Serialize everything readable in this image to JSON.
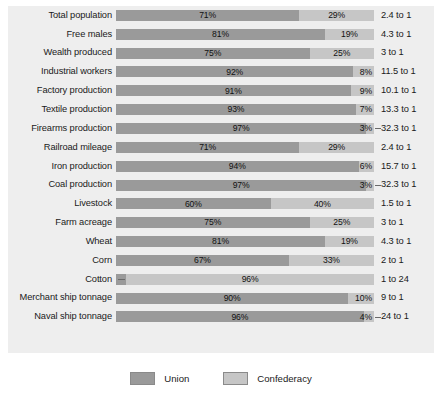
{
  "chart_data": {
    "type": "bar",
    "subtype": "stacked-horizontal-100-percent",
    "title": "",
    "xlabel": "",
    "ylabel": "",
    "xlim": [
      0,
      100
    ],
    "grid": false,
    "legend_position": "bottom-center",
    "categories": [
      "Total population",
      "Free males",
      "Wealth produced",
      "Industrial workers",
      "Factory production",
      "Textile production",
      "Firearms production",
      "Railroad mileage",
      "Iron production",
      "Coal production",
      "Livestock",
      "Farm acreage",
      "Wheat",
      "Corn",
      "Cotton",
      "Merchant ship tonnage",
      "Naval ship tonnage"
    ],
    "series": [
      {
        "name": "Union",
        "color": "#9a9a9a",
        "values": [
          71,
          81,
          75,
          92,
          91,
          93,
          97,
          71,
          94,
          97,
          60,
          75,
          81,
          67,
          4,
          90,
          96
        ]
      },
      {
        "name": "Confederacy",
        "color": "#c6c6c6",
        "values": [
          29,
          19,
          25,
          8,
          9,
          7,
          3,
          29,
          6,
          3,
          40,
          25,
          19,
          33,
          96,
          10,
          4
        ]
      }
    ],
    "annotations": {
      "column_header": "",
      "ratios": [
        "2.4 to 1",
        "4.3 to 1",
        "3 to 1",
        "11.5 to 1",
        "10.1 to 1",
        "13.3 to 1",
        "32.3 to 1",
        "2.4 to 1",
        "15.7 to 1",
        "32.3 to 1",
        "1.5 to 1",
        "3 to 1",
        "4.3 to 1",
        "2 to 1",
        "1 to 24",
        "9 to 1",
        "24 to 1"
      ]
    }
  },
  "rows": [
    {
      "label": "Total population",
      "union": 71,
      "conf": 29,
      "union_label": "71%",
      "conf_label": "29%",
      "ratio": "2.4 to 1",
      "conf_leader": false,
      "reversed": false
    },
    {
      "label": "Free males",
      "union": 81,
      "conf": 19,
      "union_label": "81%",
      "conf_label": "19%",
      "ratio": "4.3 to 1",
      "conf_leader": false,
      "reversed": false
    },
    {
      "label": "Wealth produced",
      "union": 75,
      "conf": 25,
      "union_label": "75%",
      "conf_label": "25%",
      "ratio": "3 to 1",
      "conf_leader": false,
      "reversed": false
    },
    {
      "label": "Industrial workers",
      "union": 92,
      "conf": 8,
      "union_label": "92%",
      "conf_label": "8%",
      "ratio": "11.5 to 1",
      "conf_leader": false,
      "reversed": false
    },
    {
      "label": "Factory production",
      "union": 91,
      "conf": 9,
      "union_label": "91%",
      "conf_label": "9%",
      "ratio": "10.1 to 1",
      "conf_leader": false,
      "reversed": false
    },
    {
      "label": "Textile production",
      "union": 93,
      "conf": 7,
      "union_label": "93%",
      "conf_label": "7%",
      "ratio": "13.3 to 1",
      "conf_leader": false,
      "reversed": false
    },
    {
      "label": "Firearms production",
      "union": 97,
      "conf": 3,
      "union_label": "97%",
      "conf_label": "3%",
      "ratio": "32.3 to 1",
      "conf_leader": true,
      "reversed": false
    },
    {
      "label": "Railroad mileage",
      "union": 71,
      "conf": 29,
      "union_label": "71%",
      "conf_label": "29%",
      "ratio": "2.4 to 1",
      "conf_leader": false,
      "reversed": false
    },
    {
      "label": "Iron production",
      "union": 94,
      "conf": 6,
      "union_label": "94%",
      "conf_label": "6%",
      "ratio": "15.7 to 1",
      "conf_leader": false,
      "reversed": false
    },
    {
      "label": "Coal production",
      "union": 97,
      "conf": 3,
      "union_label": "97%",
      "conf_label": "3%",
      "ratio": "32.3 to 1",
      "conf_leader": true,
      "reversed": false
    },
    {
      "label": "Livestock",
      "union": 60,
      "conf": 40,
      "union_label": "60%",
      "conf_label": "40%",
      "ratio": "1.5 to 1",
      "conf_leader": false,
      "reversed": false
    },
    {
      "label": "Farm acreage",
      "union": 75,
      "conf": 25,
      "union_label": "75%",
      "conf_label": "25%",
      "ratio": "3 to 1",
      "conf_leader": false,
      "reversed": false
    },
    {
      "label": "Wheat",
      "union": 81,
      "conf": 19,
      "union_label": "81%",
      "conf_label": "19%",
      "ratio": "4.3 to 1",
      "conf_leader": false,
      "reversed": false
    },
    {
      "label": "Corn",
      "union": 67,
      "conf": 33,
      "union_label": "67%",
      "conf_label": "33%",
      "ratio": "2 to 1",
      "conf_leader": false,
      "reversed": false
    },
    {
      "label": "Cotton",
      "union": 4,
      "conf": 96,
      "union_label": "4%",
      "conf_label": "96%",
      "ratio": "1 to 24",
      "conf_leader": false,
      "reversed": true
    },
    {
      "label": "Merchant ship tonnage",
      "union": 90,
      "conf": 10,
      "union_label": "90%",
      "conf_label": "10%",
      "ratio": "9 to 1",
      "conf_leader": false,
      "reversed": false
    },
    {
      "label": "Naval ship tonnage",
      "union": 96,
      "conf": 4,
      "union_label": "96%",
      "conf_label": "4%",
      "ratio": "24 to 1",
      "conf_leader": true,
      "reversed": false
    }
  ],
  "legend": {
    "items": [
      {
        "label": "Union",
        "color": "#9a9a9a"
      },
      {
        "label": "Confederacy",
        "color": "#c6c6c6"
      }
    ]
  },
  "colors": {
    "union": "#9a9a9a",
    "confederacy": "#c6c6c6",
    "panel_background": "#eeeeee",
    "page_background": "#ffffff",
    "text": "#1a1a1a"
  }
}
